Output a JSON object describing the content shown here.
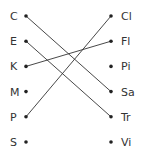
{
  "diagram": {
    "type": "matching",
    "left": [
      "C",
      "E",
      "K",
      "M",
      "P",
      "S"
    ],
    "right": [
      "Cl",
      "Fl",
      "Pi",
      "Sa",
      "Tr",
      "Vi"
    ],
    "connections": [
      {
        "from": "C",
        "to": "Sa"
      },
      {
        "from": "E",
        "to": "Tr"
      },
      {
        "from": "K",
        "to": "Fl"
      },
      {
        "from": "P",
        "to": "Cl"
      }
    ]
  }
}
